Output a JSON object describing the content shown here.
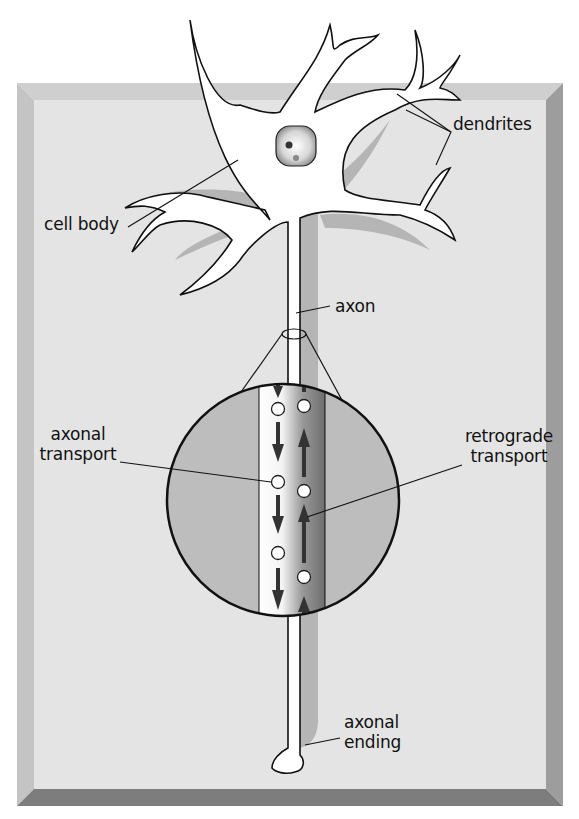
{
  "diagram": {
    "labels": {
      "dendrites": "dendrites",
      "cell_body": "cell body",
      "axon": "axon",
      "axonal_transport_line1": "axonal",
      "axonal_transport_line2": "transport",
      "retrograde_transport_line1": "retrograde",
      "retrograde_transport_line2": "transport",
      "axonal_ending_line1": "axonal",
      "axonal_ending_line2": "ending"
    },
    "colors": {
      "background_panel": "#e4e4e4",
      "frame_light": "#c8c8c8",
      "frame_dark": "#8a8a8a",
      "shadow": "#b3b3b3",
      "neuron_fill": "#ffffff",
      "outline": "#111111",
      "circle_fill": "#bdbdbd",
      "arrow": "#333333"
    },
    "transport": {
      "anterograde_direction": "down",
      "retrograde_direction": "up",
      "vesicles_left": 3,
      "vesicles_right": 3
    }
  }
}
